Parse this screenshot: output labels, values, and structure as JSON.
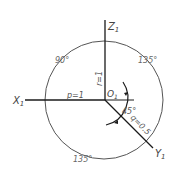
{
  "axes": {
    "x_label": "X",
    "x_sub": "1",
    "y_label": "Y",
    "y_sub": "1",
    "z_label": "Z",
    "z_sub": "1",
    "origin_label": "O",
    "origin_sub": "1"
  },
  "coefficients": {
    "p": "p=1",
    "q": "q=0.5",
    "r": "r=1"
  },
  "angles": {
    "upper_left": "90°",
    "upper_right": "135°",
    "bottom": "135°",
    "oblique": "45°"
  },
  "colors": {
    "axis": "#1a1a1a",
    "circle": "#555555",
    "label": "#444444"
  }
}
